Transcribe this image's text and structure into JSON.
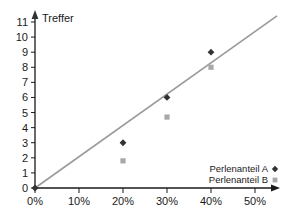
{
  "chart_data": {
    "type": "scatter",
    "title": "",
    "xlabel": "",
    "ylabel": "Treffer",
    "xlim": [
      0,
      55
    ],
    "ylim": [
      0,
      11.6
    ],
    "grid": false,
    "legend_position": "bottom-right",
    "x_tick_labels": [
      "0%",
      "10%",
      "20%",
      "30%",
      "40%",
      "50%"
    ],
    "x_tick_values": [
      0,
      10,
      20,
      30,
      40,
      50
    ],
    "y_tick_labels": [
      "0",
      "1",
      "2",
      "3",
      "4",
      "5",
      "6",
      "7",
      "8",
      "9",
      "10",
      "11"
    ],
    "y_tick_values": [
      0,
      1,
      2,
      3,
      4,
      5,
      6,
      7,
      8,
      9,
      10,
      11
    ],
    "series": [
      {
        "name": "Perlenanteil A",
        "marker": "diamond",
        "color": "#333333",
        "points": [
          {
            "x": 0,
            "y": 0
          },
          {
            "x": 20,
            "y": 3
          },
          {
            "x": 30,
            "y": 6
          },
          {
            "x": 40,
            "y": 9
          }
        ]
      },
      {
        "name": "Perlenanteil B",
        "marker": "square",
        "color": "#a8a8a8",
        "points": [
          {
            "x": 20,
            "y": 1.8
          },
          {
            "x": 30,
            "y": 4.7
          },
          {
            "x": 40,
            "y": 8
          }
        ]
      }
    ],
    "trend_line": {
      "name": "trend",
      "color": "#9a9a9a",
      "from": {
        "x": 0,
        "y": 0
      },
      "to": {
        "x": 55,
        "y": 11.4
      }
    }
  },
  "axes": {
    "y_title": "Treffer"
  },
  "legend": {
    "items": [
      {
        "label": "Perlenanteil A",
        "marker": "diamond"
      },
      {
        "label": "Perlenanteil B",
        "marker": "square"
      }
    ]
  }
}
